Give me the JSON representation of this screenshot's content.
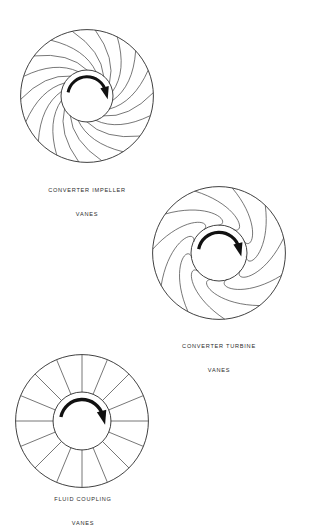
{
  "page": {
    "background_color": "#ffffff",
    "width": 309,
    "height": 510,
    "line_color": "#4a4a4a",
    "outline_color": "#2b2b2b",
    "arrow_color": "#111111",
    "caption_color": "#2b2b2b"
  },
  "figures": [
    {
      "id": "converter-impeller",
      "caption_line1": "CONVERTER IMPELLER",
      "caption_line2": "VANES",
      "vane_type": "curved-backward",
      "vane_count": 18,
      "outer_radius": 67,
      "hub_radius": 26,
      "center_x": 87,
      "center_y": 96,
      "rotation_arrow": "clockwise"
    },
    {
      "id": "converter-turbine",
      "caption_line1": "CONVERTER TURBINE",
      "caption_line2": "VANES",
      "vane_type": "s-curve",
      "vane_count": 11,
      "outer_radius": 67,
      "hub_radius": 28,
      "center_x": 219,
      "center_y": 253,
      "rotation_arrow": "clockwise"
    },
    {
      "id": "fluid-coupling",
      "caption_line1": "FLUID COUPLING",
      "caption_line2": "VANES",
      "vane_type": "straight-radial",
      "vane_count": 16,
      "outer_radius": 67,
      "hub_radius": 29,
      "center_x": 82,
      "center_y": 421,
      "rotation_arrow": "clockwise"
    }
  ],
  "chart_data": {
    "type": "diagram",
    "panels": [
      {
        "label": "CONVERTER IMPELLER VANES",
        "geometry": "curved backward-swept vanes",
        "vanes": 18,
        "hub_to_rim_ratio": 0.39,
        "rotation": "clockwise"
      },
      {
        "label": "CONVERTER TURBINE VANES",
        "geometry": "reverse S-curved vanes",
        "vanes": 11,
        "hub_to_rim_ratio": 0.42,
        "rotation": "clockwise"
      },
      {
        "label": "FLUID COUPLING VANES",
        "geometry": "straight radial vanes",
        "vanes": 16,
        "hub_to_rim_ratio": 0.43,
        "rotation": "clockwise"
      }
    ]
  }
}
